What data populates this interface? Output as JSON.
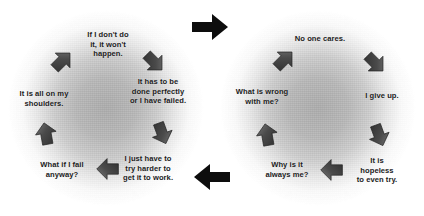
{
  "diagram": {
    "colors": {
      "text": "#1b1b1b",
      "arrow_dark": "#3a3a3a",
      "arrow_light": "#6e6e6e",
      "connector": "#0d0d0d",
      "background": "#ffffff",
      "cycle_fill": "#a8a8a8"
    }
  },
  "cycles": [
    {
      "name": "overresponsibility-cycle",
      "nodes": [
        {
          "id": "node-l1",
          "text": "If I don't do\nit, it won't\nhappen.",
          "x": 108,
          "y": 44
        },
        {
          "id": "node-l2",
          "text": "It has to be\ndone perfectly\nor I have failed.",
          "x": 158,
          "y": 91
        },
        {
          "id": "node-l3",
          "text": "I just have to\ntry harder to\nget it to work.",
          "x": 148,
          "y": 168
        },
        {
          "id": "node-l4",
          "text": "What if I fail\nanyway?",
          "x": 62,
          "y": 170
        },
        {
          "id": "node-l5",
          "text": "It is all on my\nshoulders.",
          "x": 44,
          "y": 99
        }
      ],
      "arrows": [
        {
          "id": "arrow-l1",
          "x": 62,
          "y": 61,
          "rotation": 45,
          "direction": "up-right"
        },
        {
          "id": "arrow-l2",
          "x": 154,
          "y": 62,
          "rotation": 135,
          "direction": "down-right"
        },
        {
          "id": "arrow-l3",
          "x": 162,
          "y": 133,
          "rotation": 160,
          "direction": "down"
        },
        {
          "id": "arrow-l4",
          "x": 108,
          "y": 169,
          "rotation": 270,
          "direction": "left"
        },
        {
          "id": "arrow-l5",
          "x": 46,
          "y": 134,
          "rotation": 350,
          "direction": "up"
        }
      ]
    },
    {
      "name": "hopelessness-cycle",
      "nodes": [
        {
          "id": "node-r1",
          "text": "No one cares.",
          "x": 320,
          "y": 39
        },
        {
          "id": "node-r2",
          "text": "I give up.",
          "x": 382,
          "y": 96
        },
        {
          "id": "node-r3",
          "text": "It is hopeless\nto even try.",
          "x": 377,
          "y": 170
        },
        {
          "id": "node-r4",
          "text": "Why is it\nalways me?",
          "x": 287,
          "y": 170
        },
        {
          "id": "node-r5",
          "text": "What is wrong\nwith me?",
          "x": 262,
          "y": 97
        }
      ],
      "arrows": [
        {
          "id": "arrow-r1",
          "x": 284,
          "y": 60,
          "rotation": 45,
          "direction": "up-right"
        },
        {
          "id": "arrow-r2",
          "x": 375,
          "y": 63,
          "rotation": 135,
          "direction": "down-right"
        },
        {
          "id": "arrow-r3",
          "x": 379,
          "y": 135,
          "rotation": 160,
          "direction": "down"
        },
        {
          "id": "arrow-r4",
          "x": 332,
          "y": 170,
          "rotation": 270,
          "direction": "left"
        },
        {
          "id": "arrow-r5",
          "x": 267,
          "y": 135,
          "rotation": 350,
          "direction": "up"
        }
      ]
    }
  ],
  "connectors": [
    {
      "id": "connector-top",
      "direction": "right",
      "label": "arrow pointing right"
    },
    {
      "id": "connector-bottom",
      "direction": "left",
      "label": "arrow pointing left"
    }
  ]
}
